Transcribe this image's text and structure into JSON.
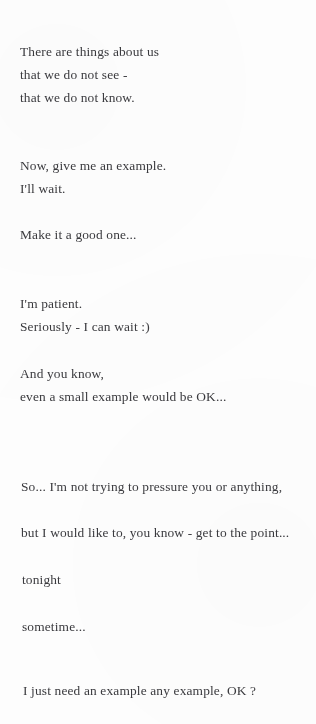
{
  "document": {
    "type": "poem-page",
    "background_color": "#fefefe",
    "text_color": "#3a3a3e",
    "lines": [
      {
        "text": "There are things about us",
        "x": 20,
        "y": 44
      },
      {
        "text": "that we do not see -",
        "x": 20,
        "y": 67
      },
      {
        "text": "that we do not know.",
        "x": 20,
        "y": 90
      },
      {
        "text": "Now, give me an example.",
        "x": 20,
        "y": 158
      },
      {
        "text": "I'll wait.",
        "x": 20,
        "y": 181
      },
      {
        "text": "Make it a good one...",
        "x": 20,
        "y": 227
      },
      {
        "text": "I'm patient.",
        "x": 20,
        "y": 296
      },
      {
        "text": "Seriously - I can wait :)",
        "x": 20,
        "y": 319
      },
      {
        "text": "And you know,",
        "x": 20,
        "y": 366
      },
      {
        "text": "even a small example would be OK...",
        "x": 20,
        "y": 389
      },
      {
        "text": "So... I'm not trying to pressure you or anything,",
        "x": 21,
        "y": 479
      },
      {
        "text": "but I would like to, you know - get to the point...",
        "x": 21,
        "y": 525
      },
      {
        "text": "tonight",
        "x": 22,
        "y": 572
      },
      {
        "text": "sometime...",
        "x": 22,
        "y": 619
      },
      {
        "text": "I just need an example any example, OK ?",
        "x": 23,
        "y": 683
      }
    ]
  }
}
